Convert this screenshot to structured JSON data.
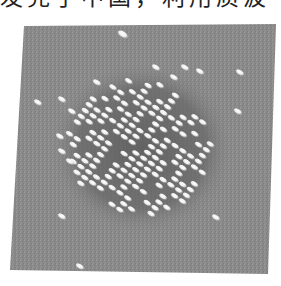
{
  "page": {
    "truncated_text_line": "发完了中国，利用质波"
  },
  "figure": {
    "panel": {
      "corners": {
        "top_left": [
          24,
          26
        ],
        "top_right": [
          276,
          24
        ],
        "bottom_right": [
          268,
          274
        ],
        "bottom_left": [
          10,
          270
        ]
      },
      "background_color": "#8a8a8a",
      "halo_color": "#6e6e6e",
      "atom_color": "#f4f4f4"
    },
    "cluster": {
      "center": [
        140,
        148
      ],
      "radius_x": 72,
      "radius_y": 68,
      "row_direction": "diagonal, upper-left to lower-right"
    },
    "isolated_atoms": [
      [
        123,
        35
      ],
      [
        240,
        73
      ],
      [
        238,
        112
      ],
      [
        38,
        103
      ],
      [
        62,
        100
      ],
      [
        72,
        112
      ],
      [
        60,
        137
      ],
      [
        62,
        152
      ],
      [
        70,
        162
      ],
      [
        62,
        217
      ],
      [
        216,
        218
      ],
      [
        80,
        267
      ],
      [
        156,
        68
      ],
      [
        185,
        68
      ],
      [
        200,
        72
      ],
      [
        174,
        78
      ],
      [
        97,
        83
      ]
    ]
  }
}
